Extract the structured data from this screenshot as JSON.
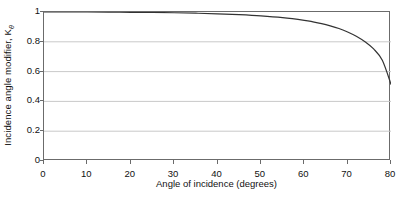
{
  "chart_data": {
    "type": "line",
    "title": "",
    "subtitle": "",
    "xlabel": "Angle of incidence (degrees)",
    "ylabel": "Incidence angle modifier, K",
    "ylabel_subscript": "θ",
    "xlim": [
      0,
      80
    ],
    "ylim": [
      0,
      1
    ],
    "xticks": [
      0,
      10,
      20,
      30,
      40,
      50,
      60,
      70,
      80
    ],
    "xtick_labels": [
      "0",
      "10",
      "20",
      "30",
      "40",
      "50",
      "60",
      "70",
      "80"
    ],
    "yticks": [
      0,
      0.2,
      0.4,
      0.6,
      0.8,
      1
    ],
    "ytick_labels": [
      "0",
      "0.2",
      "0.4",
      "0.6",
      "0.8",
      "1"
    ],
    "grid": {
      "horizontal": true,
      "vertical": false,
      "color": "#c9c9c9"
    },
    "legend": {
      "visible": false,
      "position": "none"
    },
    "series": [
      {
        "name": "Incidence angle modifier",
        "color": "#333333",
        "line_width": 1.2,
        "x": [
          0,
          5,
          10,
          15,
          20,
          25,
          30,
          35,
          40,
          45,
          50,
          55,
          60,
          62,
          64,
          66,
          68,
          70,
          72,
          74,
          76,
          78,
          80
        ],
        "values": [
          1.0,
          1.0,
          1.0,
          0.999,
          0.998,
          0.997,
          0.995,
          0.992,
          0.988,
          0.982,
          0.974,
          0.962,
          0.944,
          0.934,
          0.922,
          0.907,
          0.889,
          0.866,
          0.837,
          0.8,
          0.752,
          0.676,
          0.515
        ]
      }
    ],
    "axis_color": "#6b6b6b",
    "background": "#ffffff"
  }
}
